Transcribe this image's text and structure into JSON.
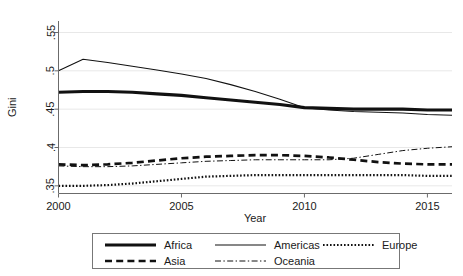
{
  "chart_data": {
    "type": "line",
    "title": "",
    "subtitle": "",
    "xlabel": "Year",
    "ylabel": "Gini",
    "xlim": [
      2000,
      2016
    ],
    "ylim": [
      0.34,
      0.565
    ],
    "xticks": [
      2000,
      2005,
      2010,
      2015
    ],
    "xtick_labels": [
      "2000",
      "2005",
      "2010",
      "2015"
    ],
    "yticks": [
      0.35,
      0.4,
      0.45,
      0.5,
      0.55
    ],
    "ytick_labels": [
      ".35",
      ".4",
      ".45",
      ".5",
      ".55"
    ],
    "grid": "horizontal",
    "legend_position": "bottom-outside",
    "legend_columns": 3,
    "x": [
      2000,
      2001,
      2002,
      2003,
      2004,
      2005,
      2006,
      2007,
      2008,
      2009,
      2010,
      2011,
      2012,
      2013,
      2014,
      2015,
      2016
    ],
    "series": [
      {
        "name": "Africa",
        "style": "solid-thick",
        "color": "#111111",
        "values": [
          0.472,
          0.473,
          0.473,
          0.472,
          0.47,
          0.468,
          0.465,
          0.462,
          0.459,
          0.456,
          0.452,
          0.451,
          0.45,
          0.45,
          0.45,
          0.449,
          0.449
        ]
      },
      {
        "name": "Americas",
        "style": "solid-thin",
        "color": "#111111",
        "values": [
          0.5,
          0.515,
          0.511,
          0.506,
          0.501,
          0.496,
          0.49,
          0.482,
          0.473,
          0.463,
          0.452,
          0.449,
          0.447,
          0.446,
          0.445,
          0.443,
          0.442
        ]
      },
      {
        "name": "Europe",
        "style": "dotted",
        "color": "#111111",
        "values": [
          0.35,
          0.35,
          0.351,
          0.353,
          0.356,
          0.359,
          0.362,
          0.363,
          0.364,
          0.364,
          0.364,
          0.364,
          0.364,
          0.364,
          0.364,
          0.363,
          0.363
        ]
      },
      {
        "name": "Asia",
        "style": "dashed",
        "color": "#111111",
        "values": [
          0.378,
          0.377,
          0.378,
          0.38,
          0.383,
          0.386,
          0.388,
          0.389,
          0.39,
          0.39,
          0.389,
          0.387,
          0.384,
          0.381,
          0.379,
          0.378,
          0.378
        ]
      },
      {
        "name": "Oceania",
        "style": "dash-dot",
        "color": "#111111",
        "values": [
          0.376,
          0.375,
          0.375,
          0.376,
          0.378,
          0.38,
          0.382,
          0.383,
          0.384,
          0.384,
          0.384,
          0.384,
          0.386,
          0.391,
          0.396,
          0.399,
          0.401
        ]
      }
    ],
    "legend": [
      {
        "label": "Africa",
        "style": "solid-thick"
      },
      {
        "label": "Americas",
        "style": "solid-thin"
      },
      {
        "label": "Europe",
        "style": "dotted"
      },
      {
        "label": "Asia",
        "style": "dashed"
      },
      {
        "label": "Oceania",
        "style": "dash-dot"
      }
    ]
  },
  "colors": {
    "background": "#ffffff",
    "ink": "#111111",
    "grid": "#e8e8e8",
    "axis": "#6b6b6b",
    "legend_border": "#777777"
  }
}
